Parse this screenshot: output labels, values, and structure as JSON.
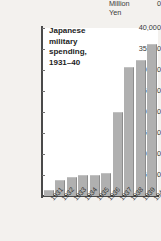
{
  "page": {
    "background_color": "#f3f1ee",
    "caption_remnant": "",
    "plot_background_color": "#ffffff",
    "axis_color": "#4a4a4a",
    "bar_color": "#b0b0b0",
    "bar_edge_color": "#8c8c8c",
    "text_color": "#2e2e2e"
  },
  "title": {
    "line1": "Japanese",
    "line2": "military",
    "line3": "spending,",
    "line4": "1931–40"
  },
  "yaxis": {
    "unit_line1": "Million",
    "unit_line2": "Yen",
    "zero_label": "0",
    "ticks": [
      {
        "label": "40,000",
        "value": 40000
      },
      {
        "label": "35,000",
        "value": 35000
      },
      {
        "label": "30,000",
        "value": 30000
      },
      {
        "label": "25,000",
        "value": 25000
      },
      {
        "label": "20,000",
        "value": 20000
      },
      {
        "label": "15,000",
        "value": 15000
      },
      {
        "label": "10,000",
        "value": 10000
      },
      {
        "label": "5,000",
        "value": 5000
      }
    ]
  },
  "chart_data": {
    "type": "bar",
    "title": "Japanese military spending, 1931–40",
    "xlabel": "",
    "ylabel": "Million Yen",
    "ylim": [
      0,
      40000
    ],
    "ytick_values": [
      0,
      5000,
      10000,
      15000,
      20000,
      25000,
      30000,
      35000,
      40000
    ],
    "ytick_labels": [
      "0",
      "5,000",
      "10,000",
      "15,000",
      "20,000",
      "25,000",
      "30,000",
      "35,000",
      "40,000"
    ],
    "grid": false,
    "legend": false,
    "categories": [
      "1931",
      "1932",
      "1933",
      "1934",
      "1935",
      "1936",
      "1937",
      "1938",
      "1939",
      "1940"
    ],
    "values": [
      1500,
      3700,
      4600,
      4900,
      5100,
      5500,
      20100,
      30700,
      32300,
      36200
    ],
    "series": [
      {
        "name": "Military spending",
        "values": [
          1500,
          3700,
          4600,
          4900,
          5100,
          5500,
          20100,
          30700,
          32300,
          36200
        ]
      }
    ]
  }
}
